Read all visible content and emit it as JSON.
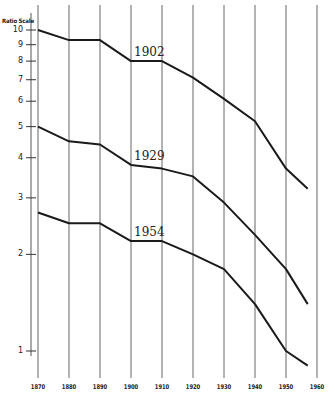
{
  "chart_data": {
    "type": "line",
    "title": "",
    "ylabel": "Ratio Scale",
    "xlabel": "",
    "y_scale": "log",
    "ylim": [
      0.9,
      10
    ],
    "xlim": [
      1870,
      1960
    ],
    "grid": {
      "vertical": true,
      "horizontal": false
    },
    "x_ticks": [
      "1870",
      "1880",
      "1890",
      "1900",
      "1910",
      "1920",
      "1930",
      "1940",
      "1950",
      "1960"
    ],
    "y_ticks": [
      "10",
      "9",
      "8",
      "7",
      "6",
      "5",
      "4",
      "3",
      "2",
      "1"
    ],
    "x": [
      1870,
      1880,
      1890,
      1900,
      1910,
      1920,
      1930,
      1940,
      1950,
      1957
    ],
    "series": [
      {
        "name": "1902",
        "values": [
          10.0,
          9.3,
          9.3,
          8.0,
          8.0,
          7.1,
          6.1,
          5.2,
          3.7,
          3.2
        ]
      },
      {
        "name": "1929",
        "values": [
          5.0,
          4.5,
          4.4,
          3.8,
          3.7,
          3.5,
          2.9,
          2.3,
          1.8,
          1.4
        ]
      },
      {
        "name": "1954",
        "values": [
          2.7,
          2.5,
          2.5,
          2.2,
          2.2,
          2.0,
          1.8,
          1.4,
          1.0,
          0.9
        ]
      }
    ],
    "annotations": [
      "1902",
      "1929",
      "1954"
    ],
    "legend": "none (series labeled inline)"
  },
  "labels": {
    "axis_title": "Ratio Scale",
    "series": [
      "1902",
      "1929",
      "1954"
    ]
  }
}
